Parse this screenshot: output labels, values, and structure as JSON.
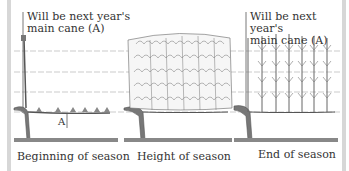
{
  "diagram": {
    "panels": [
      {
        "caption": "Beginning of season",
        "note_line1": "Will be next year's",
        "note_line2": "main cane (A)",
        "marker": "A"
      },
      {
        "caption": "Height of season"
      },
      {
        "caption": "End of season",
        "note_line1": "Will be next year's",
        "note_line2": "main cane (A)"
      }
    ],
    "colors": {
      "ink": "#555555",
      "wire": "#9a9a9a",
      "ground": "#666666",
      "frame": "#d7d7d7"
    }
  }
}
